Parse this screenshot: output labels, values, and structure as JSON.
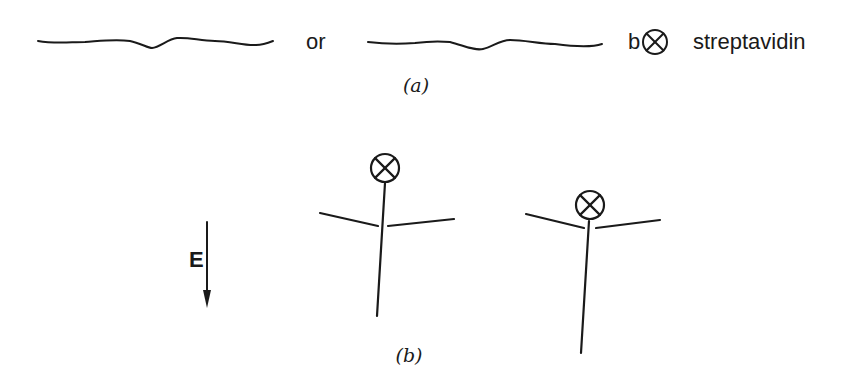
{
  "panel_a": {
    "caption": "(a)",
    "or_label": "or",
    "biotin_label": "b",
    "streptavidin_label": "streptavidin",
    "icons": [
      "wavy-dna-strand-icon",
      "wavy-dna-strand-icon",
      "streptavidin-circle-x-icon"
    ]
  },
  "panel_b": {
    "caption": "(b)",
    "field_label": "E",
    "field_direction": "down",
    "molecules": [
      {
        "name": "molecule-1",
        "tag_position": "top-of-stem"
      },
      {
        "name": "molecule-2",
        "tag_position": "at-junction"
      }
    ]
  },
  "colors": {
    "ink": "#1a1a1a",
    "background": "#ffffff"
  }
}
